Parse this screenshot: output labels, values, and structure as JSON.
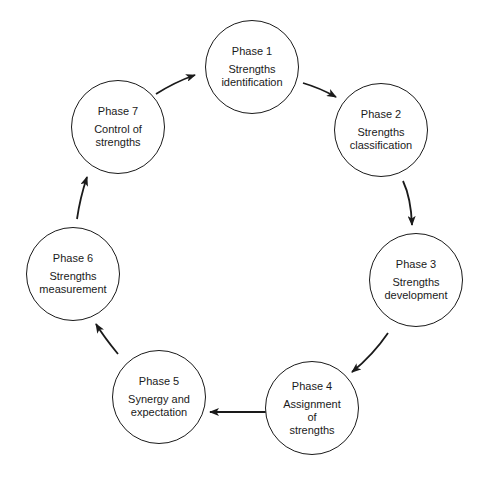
{
  "diagram": {
    "type": "cycle",
    "phases": [
      {
        "id": 1,
        "title": "Phase 1",
        "lines": [
          "Strengths",
          "identification"
        ]
      },
      {
        "id": 2,
        "title": "Phase 2",
        "lines": [
          "Strengths",
          "classification"
        ]
      },
      {
        "id": 3,
        "title": "Phase 3",
        "lines": [
          "Strengths",
          "development"
        ]
      },
      {
        "id": 4,
        "title": "Phase 4",
        "lines": [
          "Assignment",
          "of",
          "strengths"
        ]
      },
      {
        "id": 5,
        "title": "Phase 5",
        "lines": [
          "Synergy and",
          "expectation"
        ]
      },
      {
        "id": 6,
        "title": "Phase 6",
        "lines": [
          "Strengths",
          "measurement"
        ]
      },
      {
        "id": 7,
        "title": "Phase 7",
        "lines": [
          "Control of",
          "strengths"
        ]
      }
    ],
    "flow": [
      "1->2",
      "2->3",
      "3->4",
      "4->5",
      "5->6",
      "6->7",
      "7->1"
    ],
    "colors": {
      "stroke": "#1a1a1a",
      "background": "#ffffff"
    }
  }
}
